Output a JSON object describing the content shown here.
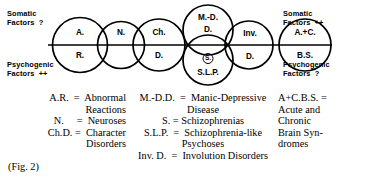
{
  "figure": {
    "caption": "(Fig. 2)",
    "axis": {
      "top_left_label": "Somatic\nFactors  ?",
      "bottom_left_label": "Psychogenic\nFactors  ++",
      "top_right_label": "Somatic\nFactors  ++",
      "bottom_right_label": "Psychogenic\nFactors  ?"
    },
    "circles": [
      {
        "id": "abnormal-reactions",
        "upper": "A.",
        "lower": "R."
      },
      {
        "id": "neuroses",
        "upper": "N.",
        "lower": ""
      },
      {
        "id": "character-disorders",
        "upper": "Ch.",
        "lower": "D."
      },
      {
        "id": "manic-depressive-disease",
        "upper": "M.-D.",
        "lower": "D."
      },
      {
        "id": "schizophrenia-like-psychoses",
        "badge": "S.",
        "lower": "S.L.P."
      },
      {
        "id": "involution-disorders",
        "upper": "Inv.",
        "lower": "D."
      },
      {
        "id": "acute-chronic-brain-syndromes",
        "upper": "A.+C.",
        "lower": "B.S."
      }
    ]
  },
  "legend": {
    "columns": [
      {
        "entries": [
          "A.R.  =  Abnormal\nReactions",
          "N.     =  Neuroses",
          "Ch.D. =  Character\nDisorders"
        ]
      },
      {
        "entries": [
          "M.-D.D.  =  Manic-Depressive\nDisease",
          "S. = Schizophrenias",
          "S.L.P.  =  Schizophrenia-like\nPsychoses",
          "Inv. D.  =  Involution Disorders"
        ]
      },
      {
        "entries": [
          "A+C.B.S. =\nAcute and\nChronic\nBrain Syn-\ndromes"
        ]
      }
    ]
  },
  "style": {
    "stroke": "#000000",
    "background": "#ffffff"
  }
}
